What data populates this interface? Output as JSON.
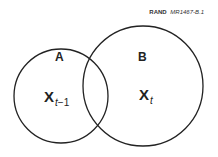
{
  "credit": {
    "org": "RAND",
    "code": "MR1467-B.1"
  },
  "sets": [
    {
      "label": "A",
      "variable": "X",
      "subscript_var": "t",
      "subscript_rest": "−1"
    },
    {
      "label": "B",
      "variable": "X",
      "subscript_var": "t",
      "subscript_rest": ""
    }
  ],
  "colors": {
    "stroke": "#222222",
    "background": "#ffffff"
  }
}
